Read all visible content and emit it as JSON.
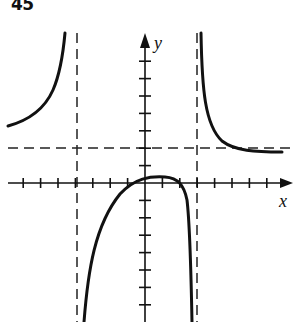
{
  "problem": {
    "number": "45"
  },
  "chart_data": {
    "type": "line",
    "title": "",
    "xlabel": "x",
    "ylabel": "y",
    "grid": false,
    "legend": null,
    "axes": {
      "origin_px": [
        145,
        183
      ],
      "unit_px": 17.4,
      "x_ticks": [
        -7,
        -6,
        -5,
        -4,
        -3,
        -2,
        -1,
        1,
        2,
        3,
        4,
        5,
        6,
        7
      ],
      "y_ticks_above": [
        1,
        2,
        3,
        4,
        5,
        6,
        7
      ],
      "y_ticks_below": [
        -1,
        -2,
        -3,
        -4,
        -5,
        -6,
        -7
      ],
      "xlim": [
        -8,
        8.5
      ],
      "ylim": [
        -8,
        8.5
      ]
    },
    "asymptotes": {
      "vertical": [
        -4,
        3
      ],
      "horizontal": [
        2
      ]
    },
    "series": [
      {
        "name": "left-branch",
        "points": [
          [
            -7.9,
            3.3
          ],
          [
            -7,
            3.7
          ],
          [
            -6,
            4.4
          ],
          [
            -5.3,
            5.5
          ],
          [
            -4.9,
            7
          ],
          [
            -4.6,
            8.6
          ]
        ]
      },
      {
        "name": "middle-branch",
        "points": [
          [
            -3.5,
            -8
          ],
          [
            -3.2,
            -5
          ],
          [
            -2.8,
            -3
          ],
          [
            -2,
            -1.3
          ],
          [
            -1,
            -0.1
          ],
          [
            0,
            0.3
          ],
          [
            0.7,
            0.4
          ],
          [
            1.5,
            0.3
          ],
          [
            2,
            0
          ],
          [
            2.4,
            -1.5
          ],
          [
            2.6,
            -4
          ],
          [
            2.7,
            -8
          ]
        ]
      },
      {
        "name": "right-branch",
        "points": [
          [
            3.2,
            8.6
          ],
          [
            3.3,
            6
          ],
          [
            3.5,
            4.5
          ],
          [
            3.9,
            3.2
          ],
          [
            4.6,
            2.3
          ],
          [
            5.5,
            1.95
          ],
          [
            6.5,
            1.85
          ],
          [
            7.9,
            1.8
          ]
        ]
      }
    ],
    "annotations": [
      "45"
    ]
  }
}
